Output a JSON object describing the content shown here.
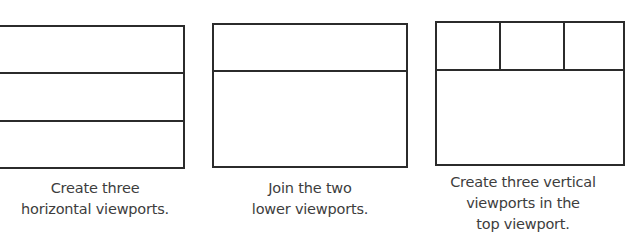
{
  "panels": [
    {
      "id": "step-1",
      "layout": "three horizontal viewports",
      "caption_lines": [
        "Create three",
        "horizontal viewports."
      ]
    },
    {
      "id": "step-2",
      "layout": "top viewport + joined lower viewport",
      "caption_lines": [
        "Join the two",
        "lower viewports."
      ]
    },
    {
      "id": "step-3",
      "layout": "three vertical viewports on top + one lower viewport",
      "caption_lines": [
        "Create three vertical",
        "viewports  in the",
        "top viewport."
      ]
    }
  ],
  "colors": {
    "line": "#2b2b2b",
    "text": "#3d3d3d",
    "background": "#ffffff"
  }
}
